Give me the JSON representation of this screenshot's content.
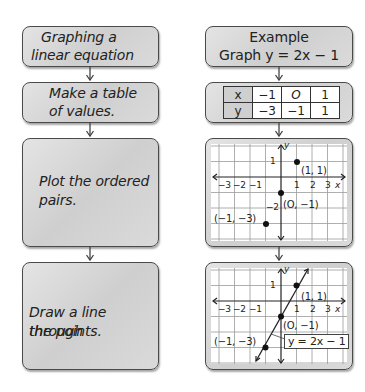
{
  "left_column": {
    "steps": [
      {
        "line1": "Graphing a",
        "line2": "linear equation"
      },
      {
        "line1": "Make a table",
        "line2": "of values."
      },
      {
        "line1": "Plot the ordered",
        "line2": "pairs."
      },
      {
        "line1": "Draw a line through",
        "line2": "the points."
      }
    ]
  },
  "right_column": {
    "example": {
      "title": "Example",
      "subtitle": "Graph y = 2x − 1"
    },
    "table": {
      "row_x": {
        "label": "x",
        "values": [
          "−1",
          "O",
          "1"
        ]
      },
      "row_y": {
        "label": "y",
        "values": [
          "−3",
          "−1",
          "1"
        ]
      }
    },
    "graph_points": {
      "x_ticks": [
        "−3",
        "−2",
        "−1",
        "1",
        "2",
        "3"
      ],
      "x_axis_label": "x",
      "y_axis_label": "y",
      "y_tick_pos": "1",
      "y_tick_neg": "−2",
      "points": [
        {
          "label": "(1, 1)"
        },
        {
          "label": "(O, −1)"
        },
        {
          "label": "(−1, −3)"
        }
      ]
    },
    "graph_line": {
      "x_ticks": [
        "−3",
        "−2",
        "−1",
        "1",
        "2",
        "3"
      ],
      "x_axis_label": "x",
      "y_axis_label": "y",
      "y_tick_pos": "1",
      "points": [
        {
          "label": "(1, 1)"
        },
        {
          "label": "(O, −1)"
        },
        {
          "label": "(−1, −3)"
        }
      ],
      "line_label": "y = 2x − 1"
    }
  },
  "colors": {
    "box_fill": "#d6d6d6",
    "border": "#4a4a4a",
    "text": "#222222",
    "grid": "#8a8a8a"
  }
}
